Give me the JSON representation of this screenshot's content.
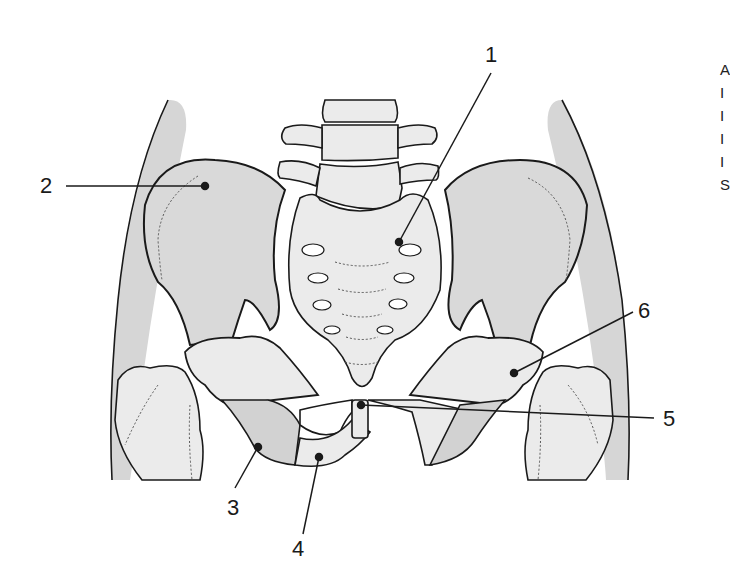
{
  "diagram": {
    "colors": {
      "bone_fill": "#e6e6e6",
      "bone_dark_fill": "#d2d2d2",
      "soft_tissue": "#d6d6d6",
      "outline": "#1a1a1a",
      "background": "#ffffff"
    },
    "labels": [
      {
        "id": "1",
        "text": "1",
        "target": "sacrum"
      },
      {
        "id": "2",
        "text": "2",
        "target": "ilium"
      },
      {
        "id": "3",
        "text": "3",
        "target": "ischium"
      },
      {
        "id": "4",
        "text": "4",
        "target": "pubis (inferior ramus)"
      },
      {
        "id": "5",
        "text": "5",
        "target": "pubic symphysis"
      },
      {
        "id": "6",
        "text": "6",
        "target": "acetabulum / hip joint"
      }
    ],
    "edge_text_fragments": [
      "A",
      "I",
      "I",
      "I",
      "I",
      "S"
    ]
  }
}
